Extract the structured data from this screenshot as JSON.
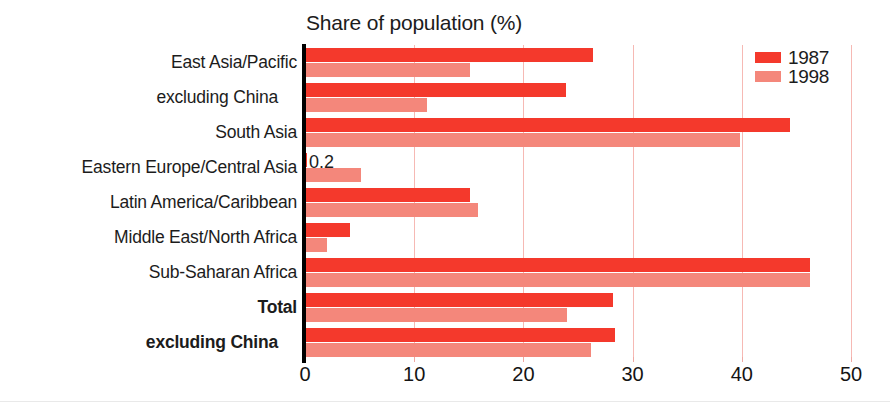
{
  "chart_data": {
    "type": "bar",
    "orientation": "horizontal",
    "title": "Share of population (%)",
    "xlabel": "",
    "ylabel": "",
    "xlim": [
      0,
      50
    ],
    "xticks": [
      0,
      10,
      20,
      30,
      40,
      50
    ],
    "grid": "vertical",
    "legend_position": "top-right",
    "categories": [
      "East Asia/Pacific",
      "excluding China",
      "South Asia",
      "Eastern Europe/Central Asia",
      "Latin America/Caribbean",
      "Middle East/North Africa",
      "Sub-Saharan Africa",
      "Total",
      "excluding China"
    ],
    "category_styles": [
      "normal",
      "indent",
      "normal",
      "normal",
      "normal",
      "normal",
      "normal",
      "bold",
      "bold-indent"
    ],
    "series": [
      {
        "name": "1987",
        "color": "#F4392C",
        "values": [
          26.4,
          23.9,
          44.4,
          0.2,
          15.1,
          4.1,
          46.2,
          28.2,
          28.4
        ]
      },
      {
        "name": "1998",
        "color": "#F4877B",
        "values": [
          15.1,
          11.2,
          39.8,
          5.1,
          15.8,
          2.0,
          46.2,
          24.0,
          26.2
        ]
      }
    ],
    "annotations": [
      {
        "text": "0.2",
        "category": "Eastern Europe/Central Asia",
        "series": "1987"
      }
    ]
  },
  "legend": {
    "items": [
      {
        "label": "1987",
        "color": "#F4392C"
      },
      {
        "label": "1998",
        "color": "#F4877B"
      }
    ]
  },
  "axis": {
    "tick_labels": [
      "0",
      "10",
      "20",
      "30",
      "40",
      "50"
    ]
  },
  "colors": {
    "series_1987": "#F4392C",
    "series_1998": "#F4877B",
    "gridline": "#F6B9B4",
    "axis": "#000000",
    "text": "#1C1C1C",
    "background": "#FFFFFF"
  }
}
